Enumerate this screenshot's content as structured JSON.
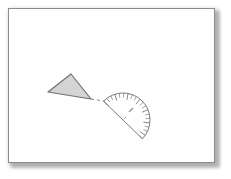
{
  "page": {
    "background_color": "#ffffff",
    "border_color": "#8c8c8c",
    "shadow_color": "#b9b9b9",
    "frame": {
      "x": 8,
      "y": 8,
      "width": 207,
      "height": 155
    }
  },
  "figure": {
    "name": "triangle-and-protractor-diagram",
    "ink_color": "#6b6b6b",
    "dark_ink_color": "#555555",
    "triangle": {
      "name": "shaded-triangle",
      "fill_color": "#d4d4d4",
      "stroke_color": "#6f6f6f",
      "points": "48,92 71,74 91,99",
      "vertices": [
        {
          "label": "left",
          "x": 48,
          "y": 92
        },
        {
          "label": "top",
          "x": 71,
          "y": 74
        },
        {
          "label": "apex",
          "x": 91,
          "y": 99
        }
      ]
    },
    "connector": {
      "name": "dashed-connector-line",
      "stroke_color": "#8a8a8a",
      "dash_pattern": "3,3",
      "from": {
        "x": 91,
        "y": 99
      },
      "to": {
        "x": 104,
        "y": 101
      }
    },
    "protractor": {
      "name": "protractor",
      "stroke_color": "#7a7a7a",
      "fill_color": "#ffffff",
      "center": {
        "x": 123,
        "y": 120
      },
      "radius": 27,
      "rotation_degrees": -44,
      "baseline_from": {
        "x": 104,
        "y": 101
      },
      "baseline_to": {
        "x": 145,
        "y": 141
      },
      "tick_count": 19,
      "major_tick_every": 3,
      "tick_length_minor": 4.5,
      "tick_length_major": 6.5,
      "center_mark": {
        "name": "protractor-center-mark",
        "x": 123,
        "y": 120,
        "color": "#6a6a6a"
      },
      "inner_mark": {
        "name": "protractor-inner-annotation",
        "x": 131,
        "y": 110,
        "color": "#9a9a9a"
      }
    }
  }
}
